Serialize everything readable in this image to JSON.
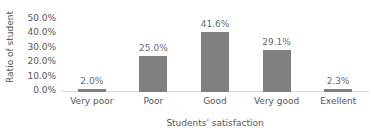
{
  "chart_data": {
    "type": "bar",
    "title": "",
    "subtitle": "",
    "xlabel": "Students' satisfaction",
    "ylabel": "Ratio of student",
    "categories": [
      "Very poor",
      "Poor",
      "Good",
      "Very good",
      "Exellent"
    ],
    "values": [
      2.0,
      25.0,
      41.6,
      29.1,
      2.3
    ],
    "data_labels": [
      "2.0%",
      "25.0%",
      "41.6%",
      "29.1%",
      "2.3%"
    ],
    "ylim": [
      0,
      50
    ],
    "ytick_values": [
      50.0,
      40.0,
      30.0,
      20.0,
      10.0,
      0.0
    ],
    "ytick_labels": [
      "50.0%",
      "40.0%",
      "30.0%",
      "20.0%",
      "10.0%",
      "0.0%"
    ],
    "grid": false,
    "legend": false,
    "legend_position": "none",
    "series": [
      {
        "name": "Ratio of student",
        "values": [
          2.0,
          25.0,
          41.6,
          29.1,
          2.3
        ]
      }
    ],
    "colors": {
      "bar_fill": "#808080",
      "data_label_text": "#6b6b6b",
      "axis_text": "#575757",
      "baseline": "#d9d9d9",
      "background": "#ffffff"
    }
  }
}
